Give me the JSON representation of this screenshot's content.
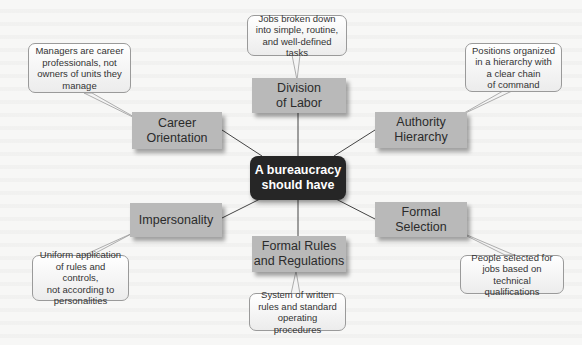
{
  "diagram": {
    "center": {
      "label_line1": "A bureaucracy",
      "label_line2": "should have"
    },
    "nodes": [
      {
        "id": "division-of-labor",
        "line1": "Division",
        "line2": "of Labor",
        "callout": [
          "Jobs broken down",
          "into simple, routine,",
          "and well-defined tasks"
        ]
      },
      {
        "id": "authority-hierarchy",
        "line1": "Authority",
        "line2": "Hierarchy",
        "callout": [
          "Positions organized",
          "in a hierarchy with",
          "a clear chain",
          "of command"
        ]
      },
      {
        "id": "formal-selection",
        "line1": "Formal",
        "line2": "Selection",
        "callout": [
          "People selected for",
          "jobs based on",
          "technical qualifications"
        ]
      },
      {
        "id": "formal-rules",
        "line1": "Formal Rules",
        "line2": "and Regulations",
        "callout": [
          "System of written",
          "rules and standard",
          "operating procedures"
        ]
      },
      {
        "id": "impersonality",
        "line1": "Impersonality",
        "line2": "",
        "callout": [
          "Uniform application",
          "of rules and controls,",
          "not according to",
          "personalities"
        ]
      },
      {
        "id": "career-orientation",
        "line1": "Career",
        "line2": "Orientation",
        "callout": [
          "Managers are career",
          "professionals, not",
          "owners of units they",
          "manage"
        ]
      }
    ]
  },
  "colors": {
    "center_fill": "#262626",
    "node_fill": "#b9b9b9",
    "callout_border": "#9a9a9a",
    "connector": "#444444"
  }
}
